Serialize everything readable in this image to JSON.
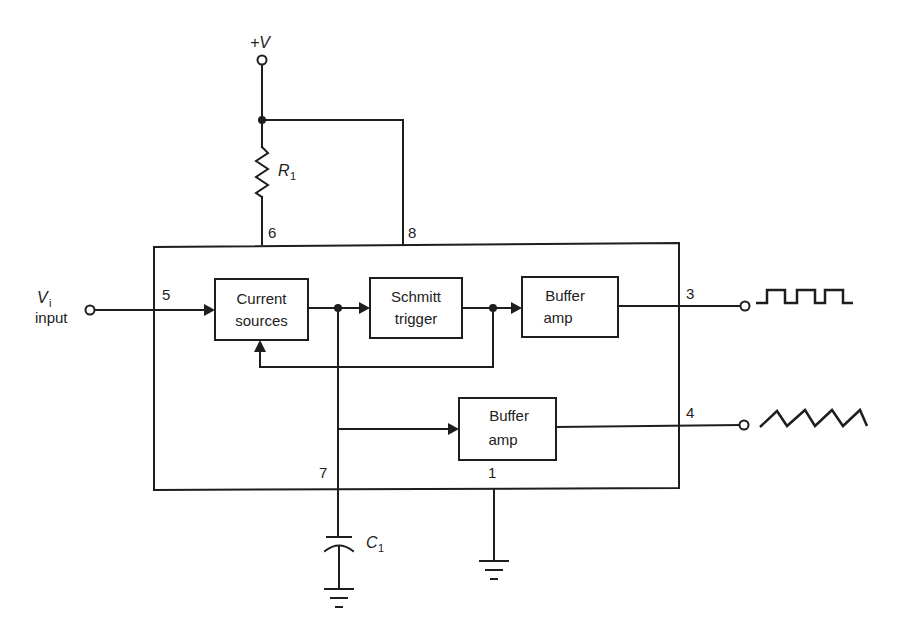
{
  "supply": {
    "label": "+V"
  },
  "resistor": {
    "label": "R",
    "subscript": "1"
  },
  "capacitor": {
    "label": "C",
    "subscript": "1"
  },
  "input": {
    "label": "V",
    "subscript": "i",
    "caption": "input"
  },
  "pins": {
    "p1": "1",
    "p3": "3",
    "p4": "4",
    "p5": "5",
    "p6": "6",
    "p7": "7",
    "p8": "8"
  },
  "blocks": {
    "current_sources": {
      "line1": "Current",
      "line2": "sources"
    },
    "schmitt_trigger": {
      "line1": "Schmitt",
      "line2": "trigger"
    },
    "buffer_amp_square": {
      "line1": "Buffer",
      "line2": "amp"
    },
    "buffer_amp_triangle": {
      "line1": "Buffer",
      "line2": "amp"
    }
  },
  "outputs": {
    "pin3_waveform": "square-wave",
    "pin4_waveform": "triangle-wave"
  }
}
